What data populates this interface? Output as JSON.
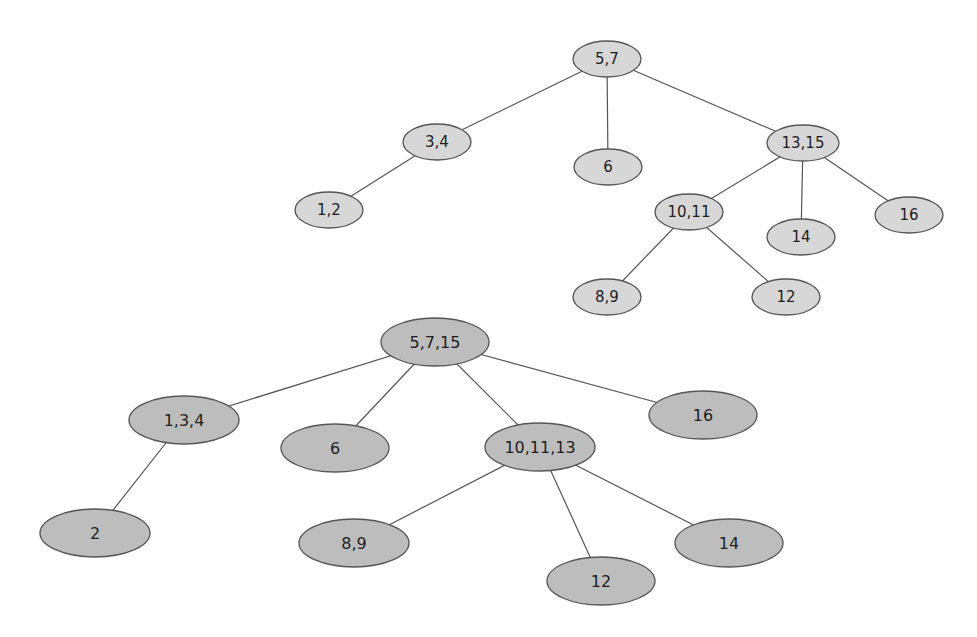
{
  "diagram": {
    "type": "tree-pair",
    "colors": {
      "background": "#ffffff",
      "edge": "#555555",
      "node_stroke": "#555555",
      "top_fill": "#d7d7d7",
      "bottom_fill": "#bdbdbd",
      "text": "#1e1e1e"
    },
    "top_tree": {
      "nodes": [
        {
          "id": "t57",
          "label": "5,7",
          "cx": 607,
          "cy": 59,
          "rx": 34,
          "ry": 18
        },
        {
          "id": "t34",
          "label": "3,4",
          "cx": 437,
          "cy": 142,
          "rx": 34,
          "ry": 18
        },
        {
          "id": "t6",
          "label": "6",
          "cx": 608,
          "cy": 167,
          "rx": 34,
          "ry": 18
        },
        {
          "id": "t1315",
          "label": "13,15",
          "cx": 803,
          "cy": 143,
          "rx": 36,
          "ry": 18
        },
        {
          "id": "t12",
          "label": "1,2",
          "cx": 329,
          "cy": 210,
          "rx": 34,
          "ry": 18
        },
        {
          "id": "t1011",
          "label": "10,11",
          "cx": 689,
          "cy": 212,
          "rx": 34,
          "ry": 18
        },
        {
          "id": "t14",
          "label": "14",
          "cx": 801,
          "cy": 237,
          "rx": 34,
          "ry": 18
        },
        {
          "id": "t16",
          "label": "16",
          "cx": 909,
          "cy": 215,
          "rx": 34,
          "ry": 18
        },
        {
          "id": "t89",
          "label": "8,9",
          "cx": 607,
          "cy": 297,
          "rx": 34,
          "ry": 18
        },
        {
          "id": "t12b",
          "label": "12",
          "cx": 786,
          "cy": 297,
          "rx": 34,
          "ry": 18
        }
      ],
      "edges": [
        [
          "t57",
          "t34"
        ],
        [
          "t57",
          "t6"
        ],
        [
          "t57",
          "t1315"
        ],
        [
          "t34",
          "t12"
        ],
        [
          "t1315",
          "t1011"
        ],
        [
          "t1315",
          "t14"
        ],
        [
          "t1315",
          "t16"
        ],
        [
          "t1011",
          "t89"
        ],
        [
          "t1011",
          "t12b"
        ]
      ]
    },
    "bottom_tree": {
      "nodes": [
        {
          "id": "b5715",
          "label": "5,7,15",
          "cx": 435,
          "cy": 342,
          "rx": 54,
          "ry": 24
        },
        {
          "id": "b134",
          "label": "1,3,4",
          "cx": 184,
          "cy": 420,
          "rx": 55,
          "ry": 24
        },
        {
          "id": "b6",
          "label": "6",
          "cx": 335,
          "cy": 448,
          "rx": 54,
          "ry": 24
        },
        {
          "id": "b101113",
          "label": "10,11,13",
          "cx": 540,
          "cy": 447,
          "rx": 55,
          "ry": 24
        },
        {
          "id": "b16",
          "label": "16",
          "cx": 703,
          "cy": 415,
          "rx": 54,
          "ry": 24
        },
        {
          "id": "b2",
          "label": "2",
          "cx": 95,
          "cy": 533,
          "rx": 55,
          "ry": 24
        },
        {
          "id": "b89",
          "label": "8,9",
          "cx": 354,
          "cy": 543,
          "rx": 55,
          "ry": 24
        },
        {
          "id": "b12",
          "label": "12",
          "cx": 601,
          "cy": 581,
          "rx": 54,
          "ry": 24
        },
        {
          "id": "b14",
          "label": "14",
          "cx": 729,
          "cy": 543,
          "rx": 54,
          "ry": 24
        }
      ],
      "edges": [
        [
          "b5715",
          "b134"
        ],
        [
          "b5715",
          "b6"
        ],
        [
          "b5715",
          "b101113"
        ],
        [
          "b5715",
          "b16"
        ],
        [
          "b134",
          "b2"
        ],
        [
          "b101113",
          "b89"
        ],
        [
          "b101113",
          "b12"
        ],
        [
          "b101113",
          "b14"
        ]
      ]
    }
  }
}
